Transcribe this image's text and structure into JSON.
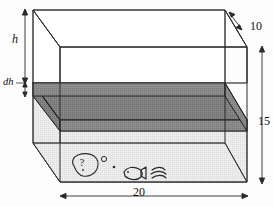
{
  "figure": {
    "shape": "rectangular-box",
    "dimension_labels": {
      "height_symbol": "h",
      "slab_thickness_symbol": "dh",
      "depth": "10",
      "height": "15",
      "width": "20"
    },
    "measurements": [
      {
        "name": "tank-height-h",
        "label": "h",
        "orientation": "vertical",
        "position": "left-outside"
      },
      {
        "name": "slab-thickness-dh",
        "label": "dh",
        "orientation": "vertical",
        "position": "left-outside-lower"
      },
      {
        "name": "tank-depth-10",
        "label": "10",
        "orientation": "diagonal",
        "position": "top-right"
      },
      {
        "name": "tank-height-15",
        "label": "15",
        "orientation": "vertical",
        "position": "right-outside"
      },
      {
        "name": "tank-width-20",
        "label": "20",
        "orientation": "horizontal",
        "position": "bottom-outside"
      }
    ],
    "scenery": {
      "rock_label": "?",
      "items": [
        "rock-with-question-mark",
        "bubble",
        "bubble-small",
        "fish",
        "seaweed"
      ]
    },
    "colors": {
      "outline": "#2b2b2b",
      "tank_fill": "#e8e8e8",
      "slab_fill": "#8a8a8a",
      "slab_top_fill": "#7d7d7d",
      "label_color": "#111111",
      "background": "#ffffff"
    }
  }
}
